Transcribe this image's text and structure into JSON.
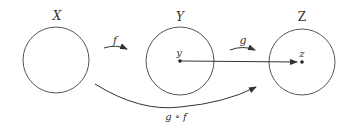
{
  "diagram": {
    "sets": [
      {
        "id": "X",
        "label": "X",
        "cx": 56,
        "cy": 60,
        "r": 33
      },
      {
        "id": "Y",
        "label": "Y",
        "cx": 180,
        "cy": 61,
        "r": 34
      },
      {
        "id": "Z",
        "label": "Z",
        "cx": 302,
        "cy": 62,
        "r": 34
      }
    ],
    "points": [
      {
        "id": "y",
        "label": "y",
        "in": "Y"
      },
      {
        "id": "z",
        "label": "z",
        "in": "Z"
      }
    ],
    "arrows": [
      {
        "id": "f",
        "label": "f",
        "from": "X",
        "to": "Y"
      },
      {
        "id": "g",
        "label": "g",
        "from": "Y",
        "to": "Z"
      },
      {
        "id": "g_of_f",
        "label": "g ∘ f",
        "from": "X",
        "to": "Z"
      },
      {
        "id": "y_to_z",
        "label": "",
        "from": "y",
        "to": "z"
      }
    ],
    "colors": {
      "stroke": "#555555",
      "text": "#333333",
      "background": "#ffffff"
    }
  }
}
